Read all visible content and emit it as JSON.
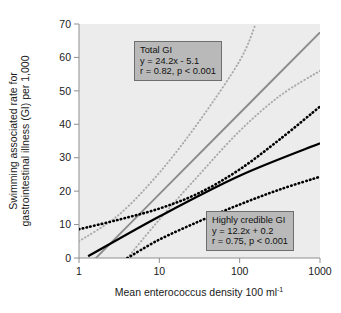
{
  "chart_data": {
    "type": "line",
    "title": "",
    "xlabel": "Mean enterococcus density 100 ml-1",
    "xlabel_base": "Mean enterococcus density 100 ml",
    "xlabel_sup": "-1",
    "ylabel_line1": "Swimming associated rate for",
    "ylabel_line2": "gastrointestinal illness (GI) per 1,000",
    "xscale": "log",
    "xlim": [
      1,
      1000
    ],
    "ylim": [
      0,
      70
    ],
    "xticks": [
      1,
      10,
      100,
      1000
    ],
    "xtick_labels": [
      "1",
      "10",
      "100",
      "1000"
    ],
    "yticks": [
      0,
      10,
      20,
      30,
      40,
      50,
      60,
      70
    ],
    "ytick_labels": [
      "0",
      "10",
      "20",
      "30",
      "40",
      "50",
      "60",
      "70"
    ],
    "grid": false,
    "legend": "none",
    "plot_background": "#ececec",
    "series": [
      {
        "name": "Total GI",
        "style": "solid",
        "color": "#8c8c8c",
        "equation": "y = 24.2x - 5.1",
        "r": 0.82,
        "p": "< 0.001",
        "slope": 24.2,
        "intercept": -5.1,
        "x": [
          1,
          10,
          100,
          1000
        ],
        "values": [
          -5.1,
          19.1,
          43.3,
          67.5
        ]
      },
      {
        "name": "Total GI upper 95% bound",
        "style": "dotted",
        "color": "#a9a9a9",
        "x": [
          1,
          3.16,
          10,
          31.6,
          100,
          158
        ],
        "values": [
          5.0,
          13.0,
          25.5,
          41.0,
          59.0,
          70.0
        ]
      },
      {
        "name": "Total GI lower 95% bound",
        "style": "dotted",
        "color": "#a9a9a9",
        "x": [
          4,
          10,
          31.6,
          100,
          316,
          1000
        ],
        "values": [
          0.0,
          11.5,
          25.0,
          38.0,
          48.5,
          56.0
        ]
      },
      {
        "name": "Highly credible GI",
        "style": "solid",
        "color": "#000000",
        "equation": "y = 12.2x + 0.2",
        "r": 0.75,
        "p": "< 0.001",
        "slope": 12.2,
        "intercept": 0.2,
        "x": [
          1.3,
          10,
          100,
          1000
        ],
        "values": [
          0.5,
          12.4,
          24.6,
          34.3
        ]
      },
      {
        "name": "Highly credible GI upper 95% bound",
        "style": "dotted",
        "color": "#000000",
        "x": [
          1,
          3.16,
          10,
          31.6,
          100,
          316,
          1000
        ],
        "values": [
          8.6,
          11.5,
          14.8,
          19.5,
          26.5,
          35.5,
          45.3
        ]
      },
      {
        "name": "Highly credible GI lower 95% bound",
        "style": "dotted",
        "color": "#000000",
        "x": [
          4,
          10,
          31.6,
          100,
          316,
          1000
        ],
        "values": [
          0.0,
          5.5,
          11.0,
          16.0,
          20.5,
          24.3
        ]
      }
    ]
  },
  "annotations": {
    "total_gi": {
      "title": "Total GI",
      "equation": "y = 24.2x - 5.1",
      "stats": "r = 0.82, p < 0.001"
    },
    "highly_credible_gi": {
      "title": "Highly credible GI",
      "equation": "y = 12.2x + 0.2",
      "stats": "r = 0.75, p < 0.001"
    }
  }
}
